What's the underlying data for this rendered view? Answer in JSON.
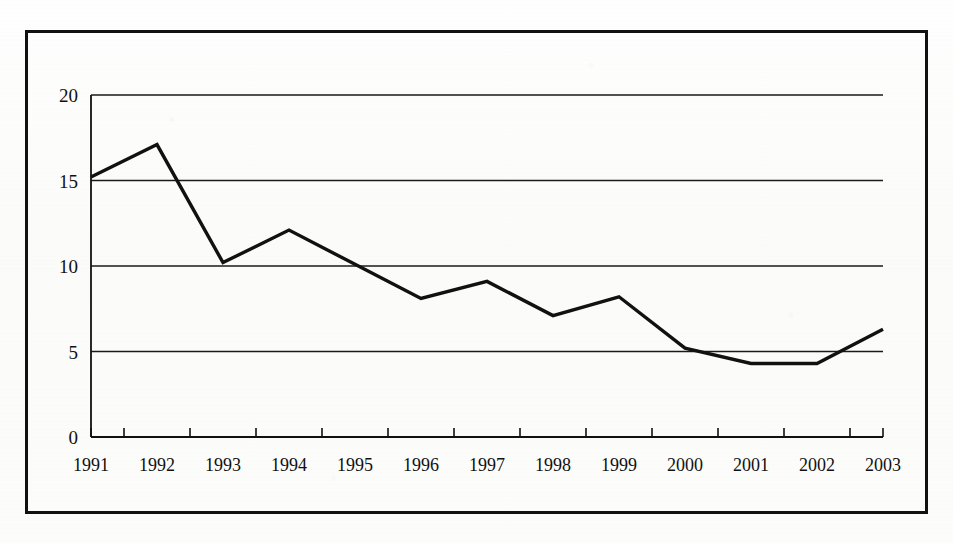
{
  "chart_data": {
    "type": "line",
    "title": "",
    "subtitle": "",
    "xlabel": "",
    "ylabel": "",
    "categories": [
      "1991",
      "1992",
      "1993",
      "1994",
      "1995",
      "1996",
      "1997",
      "1998",
      "1999",
      "2000",
      "2001",
      "2002",
      "2003"
    ],
    "series": [
      {
        "name": "",
        "values": [
          15.2,
          17.1,
          10.2,
          12.1,
          10.1,
          8.1,
          9.1,
          7.1,
          8.2,
          5.2,
          4.3,
          4.3,
          6.3
        ]
      }
    ],
    "ylim": [
      0,
      20
    ],
    "yticks": [
      0,
      5,
      10,
      15,
      20
    ],
    "ytick_labels": [
      "0",
      "5",
      "10",
      "15",
      "20"
    ],
    "xtick_labels": [
      "1991",
      "1992",
      "1993",
      "1994",
      "1995",
      "1996",
      "1997",
      "1998",
      "1999",
      "2000",
      "2001",
      "2002",
      "2003"
    ],
    "grid": true,
    "grid_axis": "y",
    "legend": false,
    "legend_position": "none",
    "line_color": "#111111",
    "line_width": 3.4,
    "markers": false,
    "annotations": []
  },
  "figure": {
    "border_color": "#111111",
    "background_color": "#fdfdfb",
    "axis_color": "#111111",
    "gridline_color": "#1a1a1a"
  }
}
